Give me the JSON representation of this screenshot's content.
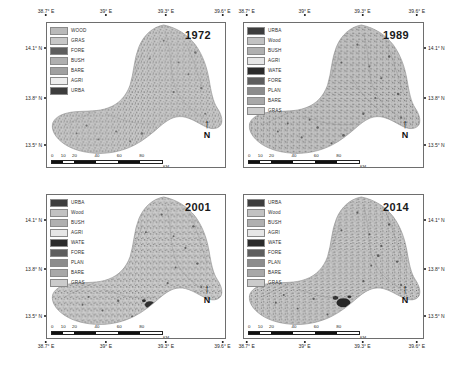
{
  "figure": {
    "scalebar": {
      "numbers": [
        "0",
        "10",
        "20",
        "40",
        "60",
        "80"
      ],
      "unit": "KM"
    },
    "north_arrow": {
      "label": "N",
      "arrow_glyph": "↑"
    },
    "axis": {
      "lon_ticks": [
        "38.7° E",
        "39° E",
        "39.3° E",
        "39.6° E"
      ],
      "lat_ticks": [
        "14.1° N",
        "13.8° N",
        "13.5° N"
      ]
    }
  },
  "panels": [
    {
      "id": "panel-1972",
      "year": "1972",
      "legend": [
        {
          "label": "WOOD",
          "color": "#b9b9b9"
        },
        {
          "label": "GRAS",
          "color": "#c7c7c7"
        },
        {
          "label": "FORE",
          "color": "#5e5e5e"
        },
        {
          "label": "BUSH",
          "color": "#afafaf"
        },
        {
          "label": "BARE",
          "color": "#a0a0a0"
        },
        {
          "label": "AGRI",
          "color": "#ededed"
        },
        {
          "label": "URBA",
          "color": "#3d3d3d"
        }
      ]
    },
    {
      "id": "panel-1989",
      "year": "1989",
      "legend": [
        {
          "label": "URBA",
          "color": "#3d3d3d"
        },
        {
          "label": "Wood",
          "color": "#c2c2c2"
        },
        {
          "label": "BUSH",
          "color": "#b0b0b0"
        },
        {
          "label": "AGRI",
          "color": "#e6e6e6"
        },
        {
          "label": "WATE",
          "color": "#2b2b2b"
        },
        {
          "label": "FORE",
          "color": "#5e5e5e"
        },
        {
          "label": "PLAN",
          "color": "#8c8c8c"
        },
        {
          "label": "BARE",
          "color": "#a8a8a8"
        },
        {
          "label": "GRAS",
          "color": "#cbcbcb"
        }
      ]
    },
    {
      "id": "panel-2001",
      "year": "2001",
      "legend": [
        {
          "label": "URBA",
          "color": "#3d3d3d"
        },
        {
          "label": "Wood",
          "color": "#c2c2c2"
        },
        {
          "label": "BUSH",
          "color": "#b0b0b0"
        },
        {
          "label": "AGRI",
          "color": "#e6e6e6"
        },
        {
          "label": "WATE",
          "color": "#2b2b2b"
        },
        {
          "label": "FORE",
          "color": "#5e5e5e"
        },
        {
          "label": "PLAN",
          "color": "#8c8c8c"
        },
        {
          "label": "BARE",
          "color": "#a8a8a8"
        },
        {
          "label": "GRAS",
          "color": "#cbcbcb"
        }
      ]
    },
    {
      "id": "panel-2014",
      "year": "2014",
      "legend": [
        {
          "label": "URBA",
          "color": "#3d3d3d"
        },
        {
          "label": "Wood",
          "color": "#c2c2c2"
        },
        {
          "label": "BUSH",
          "color": "#b0b0b0"
        },
        {
          "label": "AGRI",
          "color": "#e6e6e6"
        },
        {
          "label": "WATE",
          "color": "#2b2b2b"
        },
        {
          "label": "FORE",
          "color": "#5e5e5e"
        },
        {
          "label": "PLAN",
          "color": "#8c8c8c"
        },
        {
          "label": "BARE",
          "color": "#a8a8a8"
        },
        {
          "label": "GRAS",
          "color": "#cbcbcb"
        }
      ]
    }
  ]
}
